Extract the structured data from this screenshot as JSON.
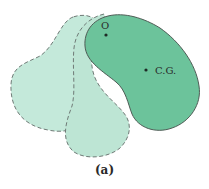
{
  "figure": {
    "caption": "(a)",
    "colors": {
      "ghost_fill": "#bfe6d6",
      "ghost_stroke": "#6f7a76",
      "body_fill": "#6cc39b",
      "body_stroke": "#4f5c56",
      "point": "#1e2a25"
    },
    "points": {
      "pivot": {
        "label": "O",
        "x": 106,
        "y": 35
      },
      "center_of_gravity": {
        "label": "C.G.",
        "x": 146,
        "y": 70
      }
    },
    "shapes": {
      "ghost_positions": 2,
      "ghost_style": "dashed",
      "body_style": "solid"
    }
  }
}
